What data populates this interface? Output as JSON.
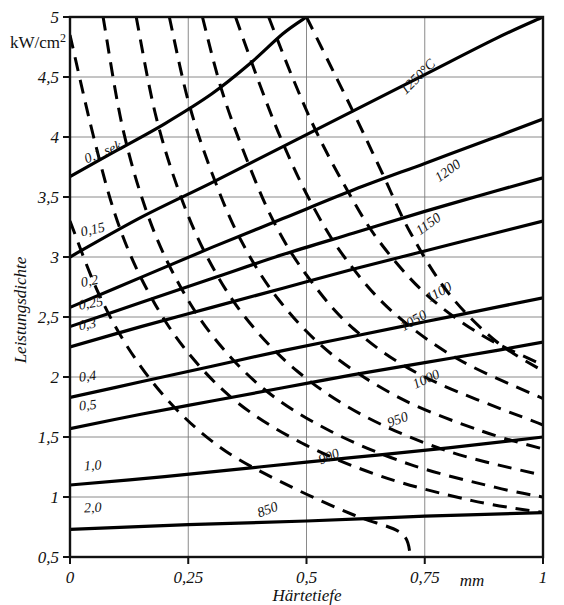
{
  "chart_data": {
    "type": "line",
    "title": "",
    "xlabel": "Härtetiefe",
    "x_unit": "mm",
    "ylabel": "Leistungsdichte",
    "y_unit": "kW/cm2",
    "y_unit_base": "kW/cm",
    "y_unit_exp": "2",
    "xlim": [
      0,
      1
    ],
    "ylim": [
      0.5,
      5
    ],
    "xticks": [
      "0",
      "0,25",
      "0,5",
      "0,75",
      "1"
    ],
    "xtick_values": [
      0,
      0.25,
      0.5,
      0.75,
      1
    ],
    "yticks": [
      "0,5",
      "1",
      "1,5",
      "2",
      "2,5",
      "3",
      "3,5",
      "4",
      "4,5",
      "5"
    ],
    "ytick_values": [
      0.5,
      1,
      1.5,
      2,
      2.5,
      3,
      3.5,
      4,
      4.5,
      5
    ],
    "grid": true,
    "legend_position": "inline-labels",
    "series": [
      {
        "name": "0,1 sek",
        "label": "0,1 sek",
        "style": "solid",
        "group": "time",
        "unit": "sek",
        "points": [
          [
            0,
            3.67
          ],
          [
            0.1,
            3.89
          ],
          [
            0.2,
            4.11
          ],
          [
            0.3,
            4.36
          ],
          [
            0.38,
            4.61
          ],
          [
            0.45,
            4.86
          ],
          [
            0.5,
            5.0
          ]
        ]
      },
      {
        "name": "0,15",
        "label": "0,15",
        "style": "solid",
        "group": "time",
        "points": [
          [
            0,
            3.0
          ],
          [
            0.15,
            3.33
          ],
          [
            0.3,
            3.62
          ],
          [
            0.45,
            3.92
          ],
          [
            0.6,
            4.22
          ],
          [
            0.75,
            4.52
          ],
          [
            0.9,
            4.82
          ],
          [
            1.0,
            5.0
          ]
        ]
      },
      {
        "name": "0,2",
        "label": "0,2",
        "style": "solid",
        "group": "time",
        "points": [
          [
            0,
            2.58
          ],
          [
            0.15,
            2.83
          ],
          [
            0.3,
            3.08
          ],
          [
            0.45,
            3.32
          ],
          [
            0.6,
            3.56
          ],
          [
            0.75,
            3.78
          ],
          [
            0.9,
            4.0
          ],
          [
            1.0,
            4.15
          ]
        ]
      },
      {
        "name": "0,25",
        "label": "0,25",
        "style": "solid",
        "group": "time",
        "points": [
          [
            0,
            2.42
          ],
          [
            0.15,
            2.62
          ],
          [
            0.3,
            2.82
          ],
          [
            0.45,
            3.02
          ],
          [
            0.6,
            3.2
          ],
          [
            0.75,
            3.38
          ],
          [
            0.9,
            3.55
          ],
          [
            1.0,
            3.66
          ]
        ]
      },
      {
        "name": "0,3",
        "label": "0,3",
        "style": "solid",
        "group": "time",
        "points": [
          [
            0,
            2.25
          ],
          [
            0.15,
            2.42
          ],
          [
            0.3,
            2.58
          ],
          [
            0.45,
            2.74
          ],
          [
            0.6,
            2.9
          ],
          [
            0.75,
            3.05
          ],
          [
            0.9,
            3.2
          ],
          [
            1.0,
            3.3
          ]
        ]
      },
      {
        "name": "0,4",
        "label": "0,4",
        "style": "solid",
        "group": "time",
        "points": [
          [
            0,
            1.83
          ],
          [
            0.15,
            1.96
          ],
          [
            0.3,
            2.09
          ],
          [
            0.45,
            2.22
          ],
          [
            0.6,
            2.34
          ],
          [
            0.75,
            2.46
          ],
          [
            0.9,
            2.58
          ],
          [
            1.0,
            2.66
          ]
        ]
      },
      {
        "name": "0,5",
        "label": "0,5",
        "style": "solid",
        "group": "time",
        "points": [
          [
            0,
            1.57
          ],
          [
            0.15,
            1.69
          ],
          [
            0.3,
            1.8
          ],
          [
            0.45,
            1.91
          ],
          [
            0.6,
            2.02
          ],
          [
            0.75,
            2.12
          ],
          [
            0.9,
            2.22
          ],
          [
            1.0,
            2.29
          ]
        ]
      },
      {
        "name": "1,0",
        "label": "1,0",
        "style": "solid",
        "group": "time",
        "points": [
          [
            0,
            1.1
          ],
          [
            0.2,
            1.17
          ],
          [
            0.4,
            1.25
          ],
          [
            0.6,
            1.33
          ],
          [
            0.8,
            1.41
          ],
          [
            1.0,
            1.5
          ]
        ]
      },
      {
        "name": "2,0",
        "label": "2,0",
        "style": "solid",
        "group": "time",
        "points": [
          [
            0,
            0.73
          ],
          [
            0.25,
            0.77
          ],
          [
            0.5,
            0.8
          ],
          [
            0.75,
            0.84
          ],
          [
            1.0,
            0.87
          ]
        ]
      },
      {
        "name": "1250",
        "label": "1250°C",
        "style": "dashed",
        "group": "temperature",
        "unit": "°C",
        "points": [
          [
            0.5,
            5.0
          ],
          [
            0.55,
            4.6
          ],
          [
            0.6,
            4.2
          ],
          [
            0.66,
            3.7
          ],
          [
            0.72,
            3.2
          ],
          [
            0.8,
            2.7
          ],
          [
            0.9,
            2.3
          ],
          [
            1.0,
            2.05
          ]
        ]
      },
      {
        "name": "1200",
        "label": "1200",
        "style": "dashed",
        "group": "temperature",
        "points": [
          [
            0.42,
            5.0
          ],
          [
            0.47,
            4.5
          ],
          [
            0.52,
            4.05
          ],
          [
            0.58,
            3.6
          ],
          [
            0.65,
            3.15
          ],
          [
            0.75,
            2.7
          ],
          [
            0.87,
            2.35
          ],
          [
            1.0,
            2.1
          ]
        ]
      },
      {
        "name": "1150",
        "label": "1150",
        "style": "dashed",
        "group": "temperature",
        "points": [
          [
            0.35,
            5.0
          ],
          [
            0.4,
            4.45
          ],
          [
            0.45,
            3.95
          ],
          [
            0.51,
            3.45
          ],
          [
            0.58,
            3.0
          ],
          [
            0.68,
            2.55
          ],
          [
            0.82,
            2.15
          ],
          [
            1.0,
            1.82
          ]
        ]
      },
      {
        "name": "1100",
        "label": "1100",
        "style": "dashed",
        "group": "temperature",
        "points": [
          [
            0.28,
            5.0
          ],
          [
            0.32,
            4.4
          ],
          [
            0.37,
            3.85
          ],
          [
            0.43,
            3.3
          ],
          [
            0.5,
            2.85
          ],
          [
            0.6,
            2.4
          ],
          [
            0.75,
            2.0
          ],
          [
            1.0,
            1.6
          ]
        ]
      },
      {
        "name": "1050",
        "label": "1050",
        "style": "dashed",
        "group": "temperature",
        "points": [
          [
            0.21,
            5.0
          ],
          [
            0.25,
            4.3
          ],
          [
            0.3,
            3.7
          ],
          [
            0.36,
            3.15
          ],
          [
            0.44,
            2.65
          ],
          [
            0.55,
            2.2
          ],
          [
            0.7,
            1.82
          ],
          [
            0.87,
            1.55
          ],
          [
            1.0,
            1.4
          ]
        ]
      },
      {
        "name": "1000",
        "label": "1000",
        "style": "dashed",
        "group": "temperature",
        "points": [
          [
            0.14,
            5.0
          ],
          [
            0.18,
            4.2
          ],
          [
            0.23,
            3.55
          ],
          [
            0.29,
            3.0
          ],
          [
            0.37,
            2.5
          ],
          [
            0.48,
            2.05
          ],
          [
            0.62,
            1.68
          ],
          [
            0.8,
            1.38
          ],
          [
            1.0,
            1.18
          ]
        ]
      },
      {
        "name": "950",
        "label": "950",
        "style": "dashed",
        "group": "temperature",
        "points": [
          [
            0.07,
            5.0
          ],
          [
            0.11,
            4.1
          ],
          [
            0.16,
            3.4
          ],
          [
            0.22,
            2.85
          ],
          [
            0.3,
            2.35
          ],
          [
            0.41,
            1.9
          ],
          [
            0.55,
            1.55
          ],
          [
            0.72,
            1.27
          ],
          [
            0.9,
            1.08
          ],
          [
            1.0,
            1.0
          ]
        ]
      },
      {
        "name": "900",
        "label": "900",
        "style": "dashed",
        "group": "temperature",
        "points": [
          [
            0.0,
            4.85
          ],
          [
            0.05,
            4.0
          ],
          [
            0.1,
            3.3
          ],
          [
            0.16,
            2.75
          ],
          [
            0.24,
            2.25
          ],
          [
            0.35,
            1.8
          ],
          [
            0.49,
            1.45
          ],
          [
            0.66,
            1.17
          ],
          [
            0.85,
            0.97
          ],
          [
            1.0,
            0.87
          ]
        ]
      },
      {
        "name": "850",
        "label": "850",
        "style": "dashed",
        "group": "temperature",
        "points": [
          [
            0.0,
            3.3
          ],
          [
            0.06,
            2.7
          ],
          [
            0.13,
            2.2
          ],
          [
            0.22,
            1.75
          ],
          [
            0.33,
            1.38
          ],
          [
            0.47,
            1.08
          ],
          [
            0.6,
            0.85
          ],
          [
            0.7,
            0.7
          ],
          [
            0.72,
            0.5
          ]
        ]
      }
    ],
    "annotations": [
      {
        "text": "0,1 sek",
        "x": 0.035,
        "y": 3.78,
        "rotation": -22,
        "for": "0,1 sek"
      },
      {
        "text": "0,15",
        "x": 0.025,
        "y": 3.17,
        "rotation": -13,
        "for": "0,15"
      },
      {
        "text": "0,2",
        "x": 0.025,
        "y": 2.75,
        "rotation": -11,
        "for": "0,2"
      },
      {
        "text": "0,25",
        "x": 0.02,
        "y": 2.56,
        "rotation": -10,
        "for": "0,25"
      },
      {
        "text": "0,3",
        "x": 0.02,
        "y": 2.39,
        "rotation": -9,
        "for": "0,3"
      },
      {
        "text": "0,4",
        "x": 0.02,
        "y": 1.96,
        "rotation": -7,
        "for": "0,4"
      },
      {
        "text": "0,5",
        "x": 0.02,
        "y": 1.72,
        "rotation": -6,
        "for": "0,5"
      },
      {
        "text": "1,0",
        "x": 0.03,
        "y": 1.22,
        "rotation": -4,
        "for": "1,0"
      },
      {
        "text": "2,0",
        "x": 0.03,
        "y": 0.87,
        "rotation": -3,
        "for": "2,0"
      },
      {
        "text": "1250°C",
        "x": 0.71,
        "y": 4.35,
        "rotation": -45,
        "for": "1250"
      },
      {
        "text": "1200",
        "x": 0.78,
        "y": 3.62,
        "rotation": -36,
        "for": "1200"
      },
      {
        "text": "1150",
        "x": 0.74,
        "y": 3.18,
        "rotation": -36,
        "for": "1150"
      },
      {
        "text": "1100",
        "x": 0.76,
        "y": 2.62,
        "rotation": -30,
        "for": "1100"
      },
      {
        "text": "1050",
        "x": 0.705,
        "y": 2.38,
        "rotation": -30,
        "for": "1050"
      },
      {
        "text": "1000",
        "x": 0.73,
        "y": 1.9,
        "rotation": -25,
        "for": "1000"
      },
      {
        "text": "950",
        "x": 0.675,
        "y": 1.58,
        "rotation": -20,
        "for": "950"
      },
      {
        "text": "900",
        "x": 0.53,
        "y": 1.27,
        "rotation": -22,
        "for": "900"
      },
      {
        "text": "850",
        "x": 0.4,
        "y": 0.83,
        "rotation": -20,
        "for": "850"
      }
    ]
  }
}
